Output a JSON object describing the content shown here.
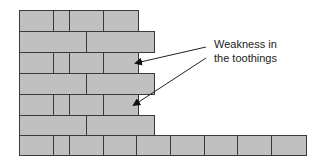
{
  "diagram": {
    "annotation": {
      "line1": "Weakness in",
      "line2": "the toothings"
    },
    "colors": {
      "brick": "#c0c0c0",
      "mortar": "#3a3a3a"
    },
    "rows": [
      {
        "y": 10,
        "h": 22,
        "bricks": [
          [
            19,
            35
          ],
          [
            53,
            17
          ],
          [
            69,
            35
          ],
          [
            103,
            35
          ]
        ]
      },
      {
        "y": 31,
        "h": 22,
        "bricks": [
          [
            19,
            68
          ],
          [
            86,
            68
          ]
        ]
      },
      {
        "y": 52,
        "h": 22,
        "bricks": [
          [
            19,
            35
          ],
          [
            53,
            17
          ],
          [
            69,
            35
          ],
          [
            103,
            35
          ]
        ]
      },
      {
        "y": 73,
        "h": 22,
        "bricks": [
          [
            19,
            68
          ],
          [
            86,
            68
          ]
        ]
      },
      {
        "y": 94,
        "h": 22,
        "bricks": [
          [
            19,
            35
          ],
          [
            53,
            17
          ],
          [
            69,
            35
          ],
          [
            103,
            35
          ]
        ]
      },
      {
        "y": 115,
        "h": 21,
        "bricks": [
          [
            19,
            68
          ],
          [
            86,
            68
          ]
        ]
      },
      {
        "y": 135,
        "h": 21,
        "bricks": [
          [
            19,
            35
          ],
          [
            53,
            17
          ],
          [
            69,
            35
          ],
          [
            103,
            34
          ],
          [
            136,
            35
          ],
          [
            170,
            35
          ],
          [
            204,
            34
          ],
          [
            237,
            35
          ],
          [
            271,
            35
          ]
        ]
      }
    ]
  }
}
